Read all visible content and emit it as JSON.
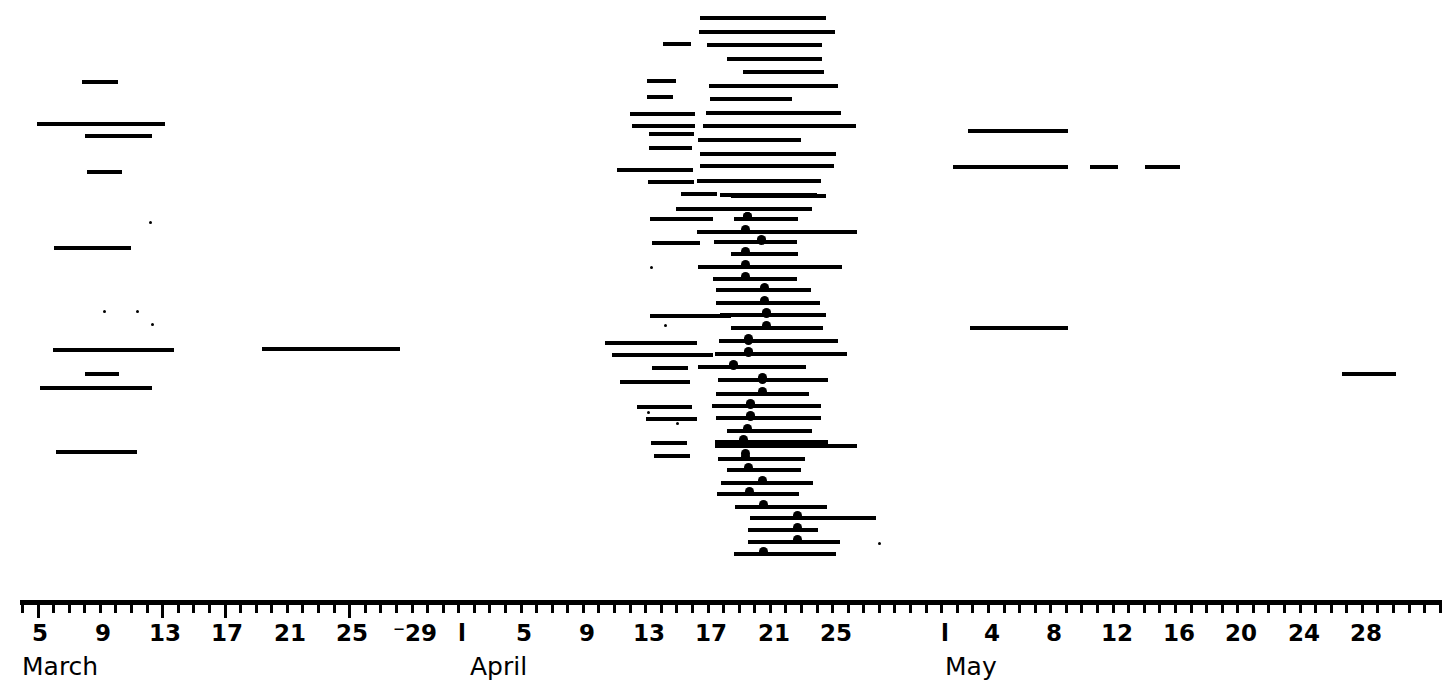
{
  "chart_data": {
    "type": "bar",
    "orientation": "horizontal",
    "title": "",
    "xlabel": "",
    "ylabel": "",
    "grid": false,
    "legend": null,
    "axis": {
      "orientation": "horizontal",
      "start_px": 20,
      "end_px": 1442,
      "px_per_day": 15.58,
      "day0_px": 8.6,
      "months": [
        {
          "name": "March",
          "label_px": 22,
          "first_day": 1
        },
        {
          "name": "April",
          "label_px": 470,
          "first_day": 32
        },
        {
          "name": "May",
          "label_px": 945,
          "first_day": 62
        }
      ],
      "major_tick_labels": [
        {
          "text": "5",
          "px": 40
        },
        {
          "text": "9",
          "px": 103
        },
        {
          "text": "13",
          "px": 165
        },
        {
          "text": "17",
          "px": 227
        },
        {
          "text": "21",
          "px": 290
        },
        {
          "text": "25",
          "px": 352
        },
        {
          "text": "⁻29",
          "px": 415
        },
        {
          "text": "l",
          "px": 462
        },
        {
          "text": "5",
          "px": 524
        },
        {
          "text": "9",
          "px": 587
        },
        {
          "text": "13",
          "px": 649
        },
        {
          "text": "17",
          "px": 711
        },
        {
          "text": "21",
          "px": 774
        },
        {
          "text": "25",
          "px": 836
        },
        {
          "text": "l",
          "px": 945
        },
        {
          "text": "4",
          "px": 992
        },
        {
          "text": "8",
          "px": 1054
        },
        {
          "text": "12",
          "px": 1117
        },
        {
          "text": "16",
          "px": 1179
        },
        {
          "text": "20",
          "px": 1241
        },
        {
          "text": "24",
          "px": 1304
        },
        {
          "text": "28",
          "px": 1366
        }
      ],
      "tick_step_px": 15.58,
      "tick_count": 92
    },
    "row_height_px": 14.4,
    "bars": [
      {
        "row": 0,
        "x0": 82,
        "x1": 118,
        "y": 80,
        "dot": null
      },
      {
        "row": 1,
        "x0": 37,
        "x1": 165,
        "y": 122,
        "dot": null
      },
      {
        "row": 2,
        "x0": 85,
        "x1": 152,
        "y": 134,
        "dot": null
      },
      {
        "row": 3,
        "x0": 87,
        "x1": 122,
        "y": 170,
        "dot": null
      },
      {
        "row": 4,
        "x0": 54,
        "x1": 131,
        "y": 246,
        "dot": null
      },
      {
        "row": 5,
        "x0": 53,
        "x1": 174,
        "y": 348,
        "dot": null
      },
      {
        "row": 6,
        "x0": 85,
        "x1": 119,
        "y": 372,
        "dot": null
      },
      {
        "row": 7,
        "x0": 40,
        "x1": 152,
        "y": 386,
        "dot": null
      },
      {
        "row": 8,
        "x0": 56,
        "x1": 137,
        "y": 450,
        "dot": null
      },
      {
        "row": 9,
        "x0": 262,
        "x1": 400,
        "y": 347,
        "dot": null
      },
      {
        "row": 10,
        "x0": 700,
        "x1": 826,
        "y": 16,
        "dot": null
      },
      {
        "row": 11,
        "x0": 699,
        "x1": 835,
        "y": 30,
        "dot": null
      },
      {
        "row": 12,
        "x0": 663,
        "x1": 691,
        "y": 42,
        "dot": null
      },
      {
        "row": 13,
        "x0": 707,
        "x1": 822,
        "y": 43,
        "dot": null
      },
      {
        "row": 14,
        "x0": 727,
        "x1": 822,
        "y": 57,
        "dot": null
      },
      {
        "row": 15,
        "x0": 743,
        "x1": 824,
        "y": 70,
        "dot": null
      },
      {
        "row": 16,
        "x0": 647,
        "x1": 676,
        "y": 79,
        "dot": null
      },
      {
        "row": 17,
        "x0": 709,
        "x1": 838,
        "y": 84,
        "dot": null
      },
      {
        "row": 18,
        "x0": 647,
        "x1": 673,
        "y": 95,
        "dot": null
      },
      {
        "row": 19,
        "x0": 710,
        "x1": 792,
        "y": 97,
        "dot": null
      },
      {
        "row": 20,
        "x0": 630,
        "x1": 695,
        "y": 112,
        "dot": null
      },
      {
        "row": 21,
        "x0": 706,
        "x1": 841,
        "y": 111,
        "dot": null
      },
      {
        "row": 22,
        "x0": 632,
        "x1": 695,
        "y": 124,
        "dot": null
      },
      {
        "row": 23,
        "x0": 703,
        "x1": 856,
        "y": 124,
        "dot": null
      },
      {
        "row": 24,
        "x0": 649,
        "x1": 694,
        "y": 132,
        "dot": null
      },
      {
        "row": 25,
        "x0": 698,
        "x1": 801,
        "y": 138,
        "dot": null
      },
      {
        "row": 26,
        "x0": 649,
        "x1": 692,
        "y": 146,
        "dot": null
      },
      {
        "row": 27,
        "x0": 700,
        "x1": 836,
        "y": 152,
        "dot": null
      },
      {
        "row": 28,
        "x0": 617,
        "x1": 693,
        "y": 168,
        "dot": null
      },
      {
        "row": 29,
        "x0": 700,
        "x1": 834,
        "y": 164,
        "dot": null
      },
      {
        "row": 30,
        "x0": 648,
        "x1": 694,
        "y": 180,
        "dot": null
      },
      {
        "row": 31,
        "x0": 697,
        "x1": 821,
        "y": 179,
        "dot": null
      },
      {
        "row": 32,
        "x0": 681,
        "x1": 717,
        "y": 192,
        "dot": null
      },
      {
        "row": 33,
        "x0": 720,
        "x1": 817,
        "y": 193,
        "dot": null
      },
      {
        "row": 34,
        "x0": 731,
        "x1": 826,
        "y": 194,
        "dot": null
      },
      {
        "row": 35,
        "x0": 676,
        "x1": 812,
        "y": 207,
        "dot": null
      },
      {
        "row": 36,
        "x0": 650,
        "x1": 713,
        "y": 217,
        "dot": 747
      },
      {
        "row": 37,
        "x0": 734,
        "x1": 798,
        "y": 217,
        "dot": 747
      },
      {
        "row": 38,
        "x0": 697,
        "x1": 857,
        "y": 230,
        "dot": 745
      },
      {
        "row": 39,
        "x0": 652,
        "x1": 700,
        "y": 241,
        "dot": 761
      },
      {
        "row": 40,
        "x0": 714,
        "x1": 797,
        "y": 240,
        "dot": 761
      },
      {
        "row": 41,
        "x0": 731,
        "x1": 798,
        "y": 252,
        "dot": 745
      },
      {
        "row": 42,
        "x0": 698,
        "x1": 842,
        "y": 265,
        "dot": 745
      },
      {
        "row": 43,
        "x0": 713,
        "x1": 797,
        "y": 277,
        "dot": 745
      },
      {
        "row": 44,
        "x0": 716,
        "x1": 811,
        "y": 288,
        "dot": 764
      },
      {
        "row": 45,
        "x0": 716,
        "x1": 820,
        "y": 301,
        "dot": 764
      },
      {
        "row": 46,
        "x0": 650,
        "x1": 731,
        "y": 314,
        "dot": 766
      },
      {
        "row": 47,
        "x0": 720,
        "x1": 826,
        "y": 313,
        "dot": 766
      },
      {
        "row": 48,
        "x0": 731,
        "x1": 823,
        "y": 326,
        "dot": 766
      },
      {
        "row": 49,
        "x0": 605,
        "x1": 697,
        "y": 341,
        "dot": 748
      },
      {
        "row": 50,
        "x0": 719,
        "x1": 838,
        "y": 339,
        "dot": 748
      },
      {
        "row": 51,
        "x0": 612,
        "x1": 713,
        "y": 353,
        "dot": 748
      },
      {
        "row": 52,
        "x0": 715,
        "x1": 847,
        "y": 352,
        "dot": 748
      },
      {
        "row": 53,
        "x0": 652,
        "x1": 688,
        "y": 366,
        "dot": 733
      },
      {
        "row": 54,
        "x0": 698,
        "x1": 806,
        "y": 365,
        "dot": 733
      },
      {
        "row": 55,
        "x0": 620,
        "x1": 690,
        "y": 380,
        "dot": 762
      },
      {
        "row": 56,
        "x0": 718,
        "x1": 828,
        "y": 378,
        "dot": 762
      },
      {
        "row": 57,
        "x0": 716,
        "x1": 809,
        "y": 392,
        "dot": 762
      },
      {
        "row": 58,
        "x0": 637,
        "x1": 692,
        "y": 405,
        "dot": 750
      },
      {
        "row": 59,
        "x0": 712,
        "x1": 821,
        "y": 404,
        "dot": 750
      },
      {
        "row": 60,
        "x0": 646,
        "x1": 697,
        "y": 417,
        "dot": 750
      },
      {
        "row": 61,
        "x0": 716,
        "x1": 821,
        "y": 416,
        "dot": 750
      },
      {
        "row": 62,
        "x0": 727,
        "x1": 812,
        "y": 429,
        "dot": 747
      },
      {
        "row": 63,
        "x0": 715,
        "x1": 828,
        "y": 440,
        "dot": 743
      },
      {
        "row": 64,
        "x0": 651,
        "x1": 687,
        "y": 441,
        "dot": null
      },
      {
        "row": 65,
        "x0": 654,
        "x1": 690,
        "y": 454,
        "dot": 745
      },
      {
        "row": 66,
        "x0": 715,
        "x1": 857,
        "y": 444,
        "dot": 745
      },
      {
        "row": 67,
        "x0": 718,
        "x1": 805,
        "y": 457,
        "dot": 745
      },
      {
        "row": 68,
        "x0": 727,
        "x1": 801,
        "y": 468,
        "dot": 748
      },
      {
        "row": 69,
        "x0": 721,
        "x1": 813,
        "y": 481,
        "dot": 762
      },
      {
        "row": 70,
        "x0": 717,
        "x1": 799,
        "y": 492,
        "dot": 749
      },
      {
        "row": 71,
        "x0": 735,
        "x1": 827,
        "y": 505,
        "dot": 763
      },
      {
        "row": 72,
        "x0": 750,
        "x1": 876,
        "y": 516,
        "dot": 797
      },
      {
        "row": 73,
        "x0": 748,
        "x1": 818,
        "y": 528,
        "dot": 797
      },
      {
        "row": 74,
        "x0": 748,
        "x1": 840,
        "y": 540,
        "dot": 797
      },
      {
        "row": 75,
        "x0": 734,
        "x1": 836,
        "y": 552,
        "dot": 763
      },
      {
        "row": 76,
        "x0": 968,
        "x1": 1068,
        "y": 129,
        "dot": null
      },
      {
        "row": 77,
        "x0": 953,
        "x1": 1068,
        "y": 165,
        "dot": null
      },
      {
        "row": 78,
        "x0": 1090,
        "x1": 1118,
        "y": 165,
        "dot": null
      },
      {
        "row": 79,
        "x0": 1145,
        "x1": 1180,
        "y": 165,
        "dot": null
      },
      {
        "row": 80,
        "x0": 970,
        "x1": 1068,
        "y": 326,
        "dot": null
      },
      {
        "row": 81,
        "x0": 1342,
        "x1": 1396,
        "y": 372,
        "dot": null
      }
    ],
    "isolated_dots": [
      {
        "x": 149,
        "y": 221
      },
      {
        "x": 103,
        "y": 310
      },
      {
        "x": 136,
        "y": 310
      },
      {
        "x": 151,
        "y": 323
      },
      {
        "x": 650,
        "y": 266
      },
      {
        "x": 664,
        "y": 324
      },
      {
        "x": 647,
        "y": 411
      },
      {
        "x": 676,
        "y": 422
      },
      {
        "x": 878,
        "y": 542
      }
    ]
  },
  "axis_labels": {
    "march": "March",
    "april": "April",
    "may": "May"
  },
  "colors": {
    "foreground": "#000000",
    "background": "#ffffff"
  }
}
